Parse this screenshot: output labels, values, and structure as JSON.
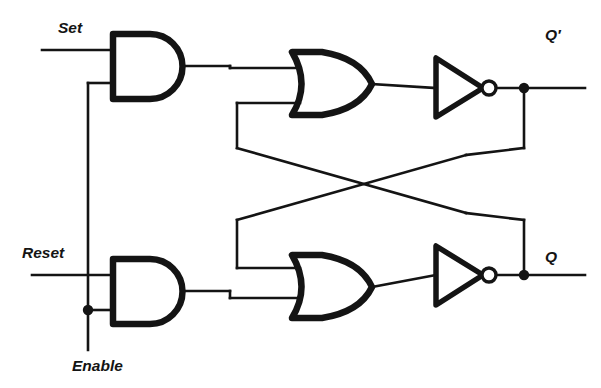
{
  "diagram": {
    "type": "logic-circuit-schematic",
    "canvas": {
      "width": 601,
      "height": 388
    },
    "colors": {
      "background": "#ffffff",
      "wire": "#141414",
      "gate_outline": "#141414",
      "label": "#141414"
    },
    "inputs": [
      {
        "id": "set",
        "label": "Set",
        "label_x": 58,
        "label_y": 33,
        "wire_y": 50,
        "wire_x_start": 42,
        "wire_x_end": 113
      },
      {
        "id": "reset",
        "label": "Reset",
        "label_x": 22,
        "label_y": 258,
        "wire_y": 275,
        "wire_x_start": 32,
        "wire_x_end": 113
      },
      {
        "id": "enable",
        "label": "Enable",
        "label_x": 72,
        "label_y": 371,
        "wire_x": 88,
        "wire_y_top": 83,
        "wire_y_bottom": 350
      }
    ],
    "outputs": [
      {
        "id": "q_not",
        "label": "Q′",
        "label_x": 545,
        "label_y": 40,
        "wire_y": 88,
        "node_x": 524,
        "wire_x_end": 585
      },
      {
        "id": "q",
        "label": "Q",
        "label_x": 545,
        "label_y": 262,
        "wire_y": 275,
        "node_x": 524,
        "wire_x_end": 585
      }
    ],
    "gates": [
      {
        "id": "and-top",
        "type": "AND",
        "x": 113,
        "y": 34,
        "width": 72,
        "height": 65,
        "input_ys": [
          50,
          83
        ],
        "output_y": 66
      },
      {
        "id": "and-bottom",
        "type": "AND",
        "x": 113,
        "y": 259,
        "width": 72,
        "height": 65,
        "input_ys": [
          275,
          308
        ],
        "output_y": 291
      },
      {
        "id": "or-top",
        "type": "OR",
        "x": 292,
        "y": 52,
        "width": 80,
        "height": 63,
        "input_ys": [
          68,
          103
        ],
        "output_y": 84
      },
      {
        "id": "or-bottom",
        "type": "OR",
        "x": 292,
        "y": 255,
        "width": 80,
        "height": 63,
        "input_ys": [
          268,
          298
        ],
        "output_y": 287
      },
      {
        "id": "inverter-top",
        "type": "NOT",
        "x": 436,
        "y": 58,
        "width": 47,
        "height": 58,
        "bubble_cx": 489,
        "bubble_r": 7,
        "output_y": 88
      },
      {
        "id": "inverter-bottom",
        "type": "NOT",
        "x": 436,
        "y": 246,
        "width": 47,
        "height": 58,
        "bubble_cx": 489,
        "bubble_r": 7,
        "output_y": 275
      }
    ],
    "junction_dots": [
      {
        "id": "enable-tap",
        "x": 88,
        "y": 310
      },
      {
        "id": "q-not-tap",
        "x": 524,
        "y": 88
      },
      {
        "id": "q-tap",
        "x": 524,
        "y": 275
      }
    ],
    "crossing": {
      "id": "feedback-crossover",
      "x": 382,
      "y": 184,
      "note": "cross-coupled feedback"
    },
    "feedback_paths": [
      {
        "id": "q-to-or-top",
        "from": "q",
        "to": "or-top-lower-input"
      },
      {
        "id": "q-not-to-or-bottom",
        "from": "q_not",
        "to": "or-bottom-upper-input"
      }
    ]
  }
}
